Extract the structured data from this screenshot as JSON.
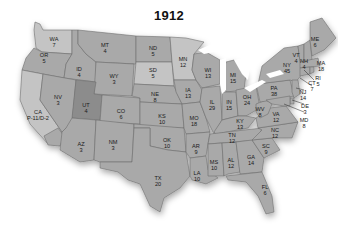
{
  "title": "1912",
  "colors": {
    "background": "#ffffff",
    "default_state": "#a9a9a9",
    "light_state": "#c4c4c4",
    "dark_state": "#8c8c8c",
    "water": "#ffffff",
    "border": "#6e6e6e"
  },
  "states": [
    {
      "abbr": "WA",
      "votes": "7"
    },
    {
      "abbr": "OR",
      "votes": "5"
    },
    {
      "abbr": "CA",
      "votes": "P-11/D-2"
    },
    {
      "abbr": "ID",
      "votes": "4"
    },
    {
      "abbr": "NV",
      "votes": "3"
    },
    {
      "abbr": "MT",
      "votes": "4"
    },
    {
      "abbr": "WY",
      "votes": "3"
    },
    {
      "abbr": "UT",
      "votes": "4"
    },
    {
      "abbr": "AZ",
      "votes": "3"
    },
    {
      "abbr": "CO",
      "votes": "6"
    },
    {
      "abbr": "NM",
      "votes": "3"
    },
    {
      "abbr": "ND",
      "votes": "5"
    },
    {
      "abbr": "SD",
      "votes": "5"
    },
    {
      "abbr": "NE",
      "votes": "8"
    },
    {
      "abbr": "KS",
      "votes": "10"
    },
    {
      "abbr": "OK",
      "votes": "10"
    },
    {
      "abbr": "TX",
      "votes": "20"
    },
    {
      "abbr": "MN",
      "votes": "12"
    },
    {
      "abbr": "IA",
      "votes": "13"
    },
    {
      "abbr": "MO",
      "votes": "18"
    },
    {
      "abbr": "AR",
      "votes": "9"
    },
    {
      "abbr": "LA",
      "votes": "10"
    },
    {
      "abbr": "WI",
      "votes": "13"
    },
    {
      "abbr": "IL",
      "votes": "29"
    },
    {
      "abbr": "MI",
      "votes": "15"
    },
    {
      "abbr": "IN",
      "votes": "15"
    },
    {
      "abbr": "OH",
      "votes": "24"
    },
    {
      "abbr": "KY",
      "votes": "13"
    },
    {
      "abbr": "TN",
      "votes": "12"
    },
    {
      "abbr": "MS",
      "votes": "10"
    },
    {
      "abbr": "AL",
      "votes": "12"
    },
    {
      "abbr": "GA",
      "votes": "14"
    },
    {
      "abbr": "FL",
      "votes": "6"
    },
    {
      "abbr": "SC",
      "votes": "9"
    },
    {
      "abbr": "NC",
      "votes": "12"
    },
    {
      "abbr": "VA",
      "votes": "12"
    },
    {
      "abbr": "WV",
      "votes": "8"
    },
    {
      "abbr": "PA",
      "votes": "38"
    },
    {
      "abbr": "NY",
      "votes": "45"
    },
    {
      "abbr": "VT",
      "votes": "4"
    },
    {
      "abbr": "NH",
      "votes": "4"
    },
    {
      "abbr": "ME",
      "votes": "6"
    },
    {
      "abbr": "MA",
      "votes": "18"
    },
    {
      "abbr": "RI",
      "votes": "5"
    },
    {
      "abbr": "CT",
      "votes": "7"
    },
    {
      "abbr": "NJ",
      "votes": "14"
    },
    {
      "abbr": "DE",
      "votes": "3"
    },
    {
      "abbr": "MD",
      "votes": "8"
    }
  ]
}
